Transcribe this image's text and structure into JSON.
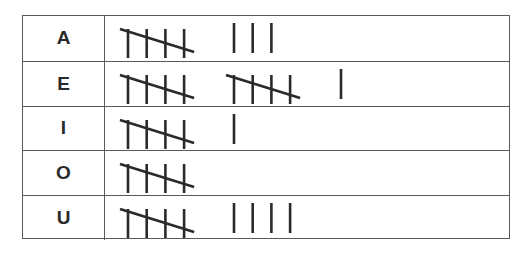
{
  "chart_data": {
    "type": "table",
    "title": "",
    "columns": [
      "Vowel",
      "Tally"
    ],
    "categories": [
      "A",
      "E",
      "I",
      "O",
      "U"
    ],
    "values": [
      8,
      11,
      6,
      5,
      9
    ],
    "rows": [
      {
        "label": "A",
        "count": 8,
        "groups": [
          5,
          3
        ]
      },
      {
        "label": "E",
        "count": 11,
        "groups": [
          5,
          5,
          1
        ]
      },
      {
        "label": "I",
        "count": 6,
        "groups": [
          5,
          1
        ]
      },
      {
        "label": "O",
        "count": 5,
        "groups": [
          5
        ]
      },
      {
        "label": "U",
        "count": 9,
        "groups": [
          5,
          4
        ]
      }
    ]
  },
  "style": {
    "line_color": "#2a2a2a",
    "border_color": "#5a5a5a"
  }
}
